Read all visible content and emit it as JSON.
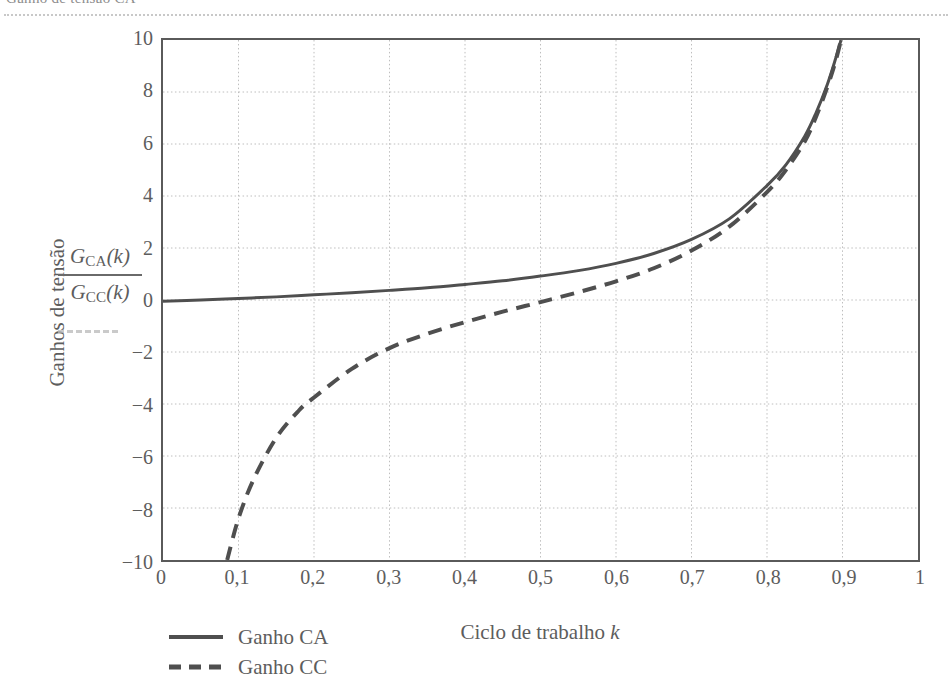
{
  "page": {
    "scan_artifact_text": "Ganho de tensão CA",
    "background_color": "#ffffff"
  },
  "chart_data": {
    "type": "line",
    "title": "",
    "xlabel": "Ciclo de trabalho k",
    "ylabel": "Ganhos de tensão",
    "ylabel_fraction": {
      "numerator": "G_CA(k)",
      "numerator_symbol": "G",
      "numerator_subscript": "CA",
      "numerator_arg": "(k)",
      "denominator": "G_CC(k)",
      "denominator_symbol": "G",
      "denominator_subscript": "CC",
      "denominator_arg": "(k)"
    },
    "xlim": [
      0,
      1
    ],
    "ylim": [
      -10,
      10
    ],
    "grid": true,
    "grid_style": "dotted",
    "grid_color": "#bdbdbd",
    "axis_color": "#5a5a5a",
    "legend_position": "below-left",
    "xticks": [
      0,
      0.1,
      0.2,
      0.3,
      0.4,
      0.5,
      0.6,
      0.7,
      0.8,
      0.9,
      1
    ],
    "xtick_labels": [
      "0",
      "0,1",
      "0,2",
      "0,3",
      "0,4",
      "0,5",
      "0,6",
      "0,7",
      "0,8",
      "0,9",
      "1"
    ],
    "yticks": [
      10,
      8,
      6,
      4,
      2,
      0,
      -2,
      -4,
      -6,
      -8,
      -10
    ],
    "ytick_labels": [
      "10",
      "8",
      "6",
      "4",
      "2",
      "0",
      "−2",
      "−4",
      "−6",
      "−8",
      "−10"
    ],
    "series": [
      {
        "name": "Ganho CA",
        "style": "solid",
        "color": "#4f4f4f",
        "width": 3,
        "x": [
          0,
          0.05,
          0.1,
          0.15,
          0.2,
          0.25,
          0.3,
          0.35,
          0.4,
          0.45,
          0.5,
          0.55,
          0.6,
          0.65,
          0.7,
          0.75,
          0.8,
          0.825,
          0.85,
          0.865,
          0.88,
          0.89,
          0.898
        ],
        "values": [
          -0.05,
          0.0,
          0.06,
          0.12,
          0.2,
          0.28,
          0.37,
          0.47,
          0.6,
          0.74,
          0.92,
          1.13,
          1.41,
          1.79,
          2.33,
          3.12,
          4.4,
          5.2,
          6.3,
          7.2,
          8.3,
          9.2,
          10.0
        ]
      },
      {
        "name": "Ganho CC",
        "style": "dashed",
        "color": "#4f4f4f",
        "width": 4,
        "x": [
          0.085,
          0.1,
          0.12,
          0.15,
          0.18,
          0.2,
          0.25,
          0.3,
          0.35,
          0.4,
          0.45,
          0.5,
          0.55,
          0.6,
          0.65,
          0.7,
          0.75,
          0.8,
          0.825,
          0.85,
          0.865,
          0.88,
          0.89,
          0.898
        ],
        "values": [
          -10.0,
          -8.4,
          -6.9,
          -5.3,
          -4.25,
          -3.75,
          -2.65,
          -1.85,
          -1.3,
          -0.85,
          -0.45,
          -0.08,
          0.3,
          0.72,
          1.22,
          1.9,
          2.82,
          4.15,
          5.0,
          6.1,
          7.05,
          8.2,
          9.1,
          10.0
        ]
      }
    ],
    "legend": [
      {
        "label": "Ganho CA",
        "style": "solid"
      },
      {
        "label": "Ganho CC",
        "style": "dashed"
      }
    ]
  }
}
